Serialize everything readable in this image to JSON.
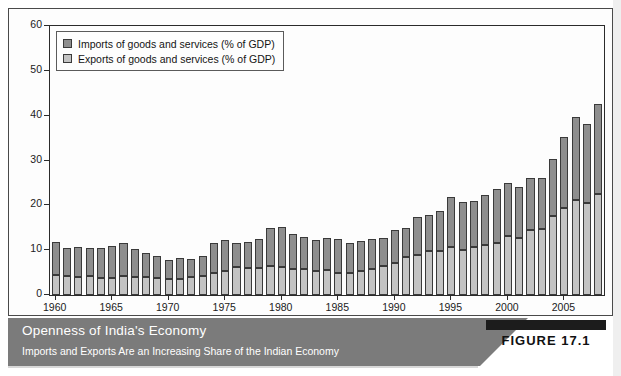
{
  "figure": {
    "badge_label": "FIGURE 17.1",
    "caption_title": "Openness of India's Economy",
    "caption_subtitle": "Imports and Exports Are an Increasing Share of the Indian Economy"
  },
  "legend": {
    "position": "top-left-inside",
    "items": [
      {
        "label": "Imports of goods and services (% of GDP)",
        "swatch": "imports-swatch",
        "color": "#8e8e8e"
      },
      {
        "label": "Exports of goods and services (% of GDP)",
        "swatch": "exports-swatch",
        "color": "#c3c3c3"
      }
    ]
  },
  "chart_data": {
    "type": "bar",
    "stacked": true,
    "title": "Openness of India's Economy",
    "subtitle": "Imports and Exports Are an Increasing Share of the Indian Economy",
    "xlabel": "",
    "ylabel": "",
    "ylim": [
      0,
      60
    ],
    "yticks": [
      0,
      10,
      20,
      30,
      40,
      50,
      60
    ],
    "ytick_labels": [
      "0",
      "10",
      "20",
      "30",
      "40",
      "50",
      "60"
    ],
    "grid": false,
    "xtick_years": [
      1960,
      1965,
      1970,
      1975,
      1980,
      1985,
      1990,
      1995,
      2000,
      2005
    ],
    "categories": [
      1960,
      1961,
      1962,
      1963,
      1964,
      1965,
      1966,
      1967,
      1968,
      1969,
      1970,
      1971,
      1972,
      1973,
      1974,
      1975,
      1976,
      1977,
      1978,
      1979,
      1980,
      1981,
      1982,
      1983,
      1984,
      1985,
      1986,
      1987,
      1988,
      1989,
      1990,
      1991,
      1992,
      1993,
      1994,
      1995,
      1996,
      1997,
      1998,
      1999,
      2000,
      2001,
      2002,
      2003,
      2004,
      2005,
      2006,
      2007,
      2008
    ],
    "series": [
      {
        "name": "Exports of goods and services (% of GDP)",
        "color": "#c3c3c3",
        "values": [
          4.5,
          4.3,
          4.1,
          4.2,
          3.9,
          3.7,
          4.2,
          4.0,
          4.1,
          3.8,
          3.6,
          3.6,
          4.1,
          4.3,
          5.0,
          5.4,
          6.3,
          6.1,
          6.0,
          6.5,
          6.2,
          5.9,
          5.7,
          5.4,
          5.6,
          5.0,
          4.9,
          5.4,
          5.7,
          6.5,
          7.1,
          8.5,
          9.0,
          9.9,
          9.8,
          10.6,
          10.1,
          10.7,
          11.2,
          11.6,
          13.2,
          12.8,
          14.5,
          14.8,
          17.6,
          19.3,
          21.1,
          20.5,
          22.5
        ]
      },
      {
        "name": "Imports of goods and services (% of GDP)",
        "color": "#8e8e8e",
        "values": [
          7.4,
          6.3,
          6.6,
          6.3,
          6.5,
          7.2,
          7.3,
          6.3,
          5.3,
          5.0,
          4.3,
          4.6,
          3.9,
          4.5,
          6.6,
          6.9,
          5.3,
          5.7,
          6.5,
          8.5,
          9.0,
          7.8,
          7.3,
          6.9,
          7.2,
          7.5,
          6.7,
          6.6,
          6.9,
          6.3,
          7.3,
          6.5,
          8.5,
          8.0,
          9.0,
          11.3,
          10.6,
          10.3,
          11.0,
          12.0,
          11.8,
          11.4,
          11.6,
          11.2,
          12.7,
          15.9,
          18.6,
          17.6,
          20.2
        ]
      }
    ],
    "totals": [
      11.9,
      10.6,
      10.7,
      10.5,
      10.4,
      10.9,
      11.5,
      10.3,
      9.4,
      8.8,
      7.9,
      8.2,
      8.0,
      8.8,
      11.6,
      12.3,
      11.6,
      11.8,
      12.5,
      15.0,
      15.2,
      13.7,
      13.0,
      12.3,
      12.8,
      12.5,
      11.6,
      12.0,
      12.6,
      12.8,
      14.4,
      15.0,
      17.5,
      17.9,
      18.8,
      21.9,
      20.7,
      21.0,
      22.2,
      23.6,
      25.0,
      24.2,
      26.1,
      26.0,
      30.3,
      35.2,
      39.7,
      38.1,
      42.7
    ]
  }
}
